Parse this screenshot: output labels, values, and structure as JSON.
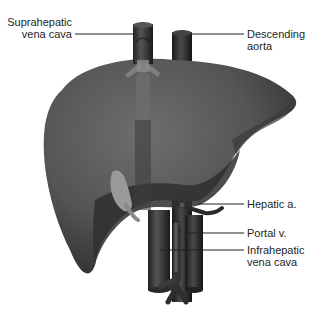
{
  "figure": {
    "labels": [
      {
        "id": "suprahepatic-vena-cava",
        "line1": "Suprahepatic",
        "line2": "vena cava"
      },
      {
        "id": "descending-aorta",
        "line1": "Descending",
        "line2": "aorta"
      },
      {
        "id": "hepatic-artery",
        "line1": "Hepatic a.",
        "line2": ""
      },
      {
        "id": "portal-vein",
        "line1": "Portal v.",
        "line2": ""
      },
      {
        "id": "infrahepatic-vena-cava",
        "line1": "Infrahepatic",
        "line2": "vena cava"
      }
    ]
  },
  "colors": {
    "liver": "#5a5a5a",
    "liver_dark": "#2e2e2e",
    "vessel": "#3a3a3a",
    "vessel_dark": "#1c1c1c",
    "gallbladder": "#9a9a9a",
    "leader_line": "#231f20",
    "background": "#ffffff"
  }
}
